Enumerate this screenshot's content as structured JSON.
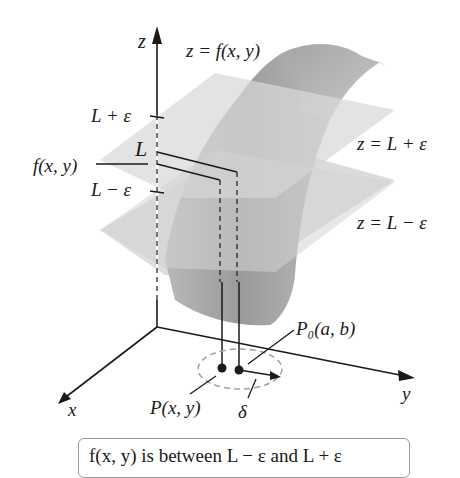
{
  "figure": {
    "axes": {
      "z_label": "z",
      "x_label": "x",
      "y_label": "y"
    },
    "surface_label": "z = f(x, y)",
    "planes": {
      "upper": "z = L + ε",
      "lower": "z = L − ε"
    },
    "z_ticks": {
      "upper": "L + ε",
      "middle": "L",
      "fvalue": "f(x, y)",
      "lower": "L − ε"
    },
    "points": {
      "p0": "P₀(a, b)",
      "p": "P(x, y)",
      "delta": "δ"
    },
    "caption": "f(x, y) is between L − ε and L + ε",
    "colors": {
      "plane": "#cfcfcf",
      "surface": "#a8a8a8",
      "line": "#1a1a1a",
      "circle": "#a0a0a0"
    }
  }
}
